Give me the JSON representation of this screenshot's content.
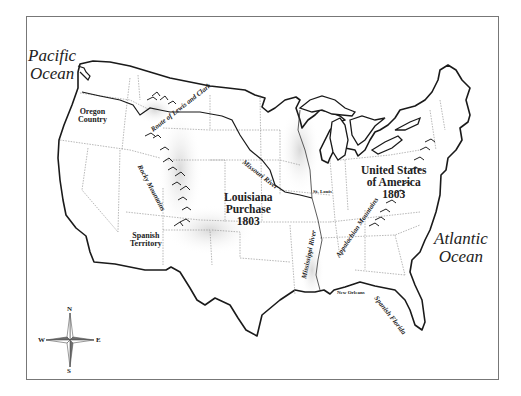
{
  "map": {
    "oceans": {
      "pacific": [
        "Pacific",
        "Ocean"
      ],
      "atlantic": [
        "Atlantic",
        "Ocean"
      ]
    },
    "regions": {
      "oregon": [
        "Oregon",
        "Country"
      ],
      "louisiana": [
        "Louisiana",
        "Purchase",
        "1803"
      ],
      "usa": [
        "United States",
        "of America",
        "1803"
      ],
      "spanish_territory": [
        "Spanish",
        "Territory"
      ],
      "spanish_florida": "Spanish Florida"
    },
    "features": {
      "lewis_clark": "Route of Lewis and Clark",
      "rocky": "Rocky Mountains",
      "missouri": "Missouri River",
      "mississippi": "Mississippi River",
      "appalachian": "Appalachian Mountains"
    },
    "cities": {
      "st_louis": "St. Louis",
      "new_orleans": "New Orleans"
    },
    "compass": {
      "n": "N",
      "s": "S",
      "e": "E",
      "w": "W"
    },
    "colors": {
      "outline": "#1a1a1a",
      "border": "#888888",
      "shade": "#d8d8d8",
      "compass_dark": "#6e6e6e"
    }
  }
}
